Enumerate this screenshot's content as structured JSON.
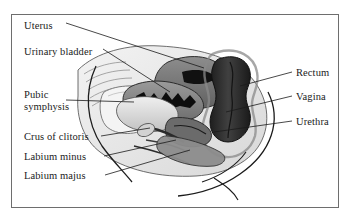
{
  "figure": {
    "frame": {
      "border_color": "#6e6e6e",
      "background": "#ffffff"
    },
    "palette": {
      "outline": "#1b1b1b",
      "dark_tissue": "#2f2f2f",
      "mid_tissue": "#7b7b7b",
      "light_tissue": "#c9c9c9",
      "pale_tissue": "#eaeaea",
      "cavity_black": "#0d0d0d",
      "background": "#ffffff"
    }
  },
  "labels_left": [
    {
      "id": "uterus",
      "text": "Uterus",
      "x": 24,
      "y": 26,
      "leader": [
        [
          66,
          31
        ],
        [
          204,
          68
        ]
      ]
    },
    {
      "id": "urinary-bladder",
      "text": "Urinary bladder",
      "x": 24,
      "y": 52,
      "leader": [
        [
          103,
          57
        ],
        [
          168,
          90
        ]
      ]
    },
    {
      "id": "pubic-symphysis-line1",
      "text": "Pubic",
      "x": 24,
      "y": 94,
      "leader": [
        [
          64,
          106
        ],
        [
          132,
          106
        ]
      ]
    },
    {
      "id": "pubic-symphysis-line2",
      "text": "symphysis",
      "x": 24,
      "y": 106,
      "leader": null
    },
    {
      "id": "crus-of-clitoris",
      "text": "Crus of clitoris",
      "x": 24,
      "y": 139,
      "leader": [
        [
          101,
          143
        ],
        [
          168,
          133
        ]
      ]
    },
    {
      "id": "labium-minus",
      "text": "Labium minus",
      "x": 24,
      "y": 159,
      "leader": [
        [
          104,
          163
        ],
        [
          183,
          139
        ]
      ]
    },
    {
      "id": "labium-majus",
      "text": "Labium majus",
      "x": 24,
      "y": 178,
      "leader": [
        [
          105,
          181
        ],
        [
          196,
          143
        ]
      ]
    }
  ],
  "labels_right": [
    {
      "id": "rectum",
      "text": "Rectum",
      "x": 296,
      "y": 75,
      "leader": [
        [
          292,
          79
        ],
        [
          243,
          88
        ]
      ]
    },
    {
      "id": "vagina",
      "text": "Vagina",
      "x": 296,
      "y": 99,
      "leader": [
        [
          292,
          103
        ],
        [
          233,
          113
        ]
      ]
    },
    {
      "id": "urethra",
      "text": "Urethra",
      "x": 296,
      "y": 124,
      "leader": [
        [
          292,
          128
        ],
        [
          218,
          133
        ]
      ]
    }
  ]
}
